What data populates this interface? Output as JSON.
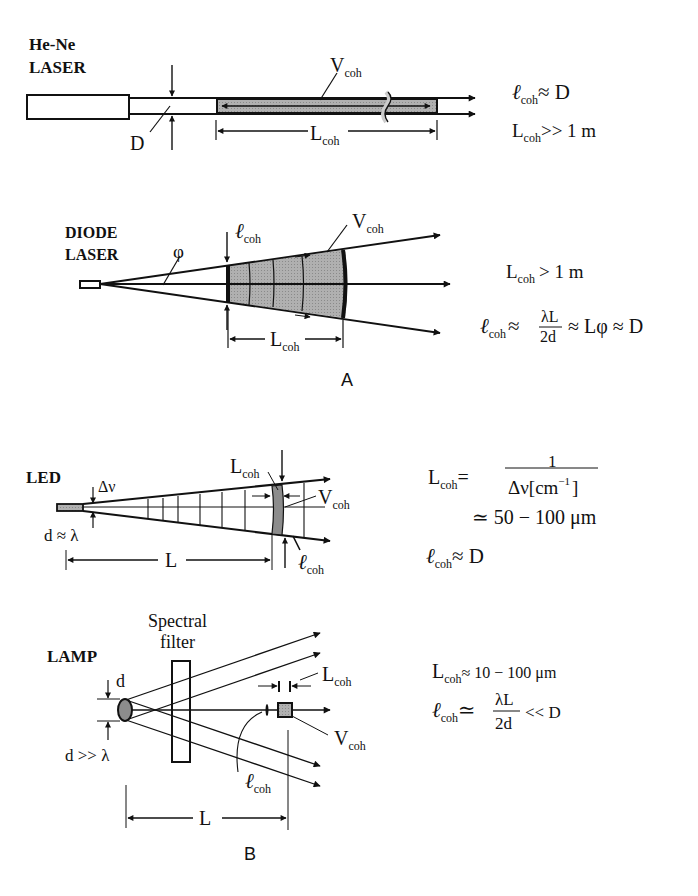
{
  "panels": {
    "A": {
      "label": "A",
      "hene": {
        "title_line1": "He-Ne",
        "title_line2": "LASER",
        "D_label": "D",
        "V_label": "V",
        "V_sub": "coh",
        "L_label": "L",
        "L_sub": "coh",
        "eq1_sym": "ℓ",
        "eq1_sub": "coh",
        "eq1_rest": "≈ D",
        "eq2_sym": "L",
        "eq2_sub": "coh",
        "eq2_rest": ">> 1 m"
      },
      "diode": {
        "title_line1": "DIODE",
        "title_line2": "LASER",
        "phi_label": "φ",
        "l_label": "ℓ",
        "l_sub": "coh",
        "V_label": "V",
        "V_sub": "coh",
        "L_label": "L",
        "L_sub": "coh",
        "eq1_sym": "L",
        "eq1_sub": "coh",
        "eq1_rest": "> 1 m",
        "eq2_sym": "ℓ",
        "eq2_sub": "coh",
        "eq2_approx": "≈",
        "eq2_num": "λL",
        "eq2_den": "2d",
        "eq2_rest": "≈ Lφ ≈ D"
      }
    },
    "B": {
      "label": "B",
      "led": {
        "title": "LED",
        "dnu_label": "Δν",
        "d_label": "d ≈ λ",
        "L_label": "L",
        "Lcoh_label": "L",
        "Lcoh_sub": "coh",
        "V_label": "V",
        "V_sub": "coh",
        "l_label": "ℓ",
        "l_sub": "coh",
        "eq1_sym": "L",
        "eq1_sub": "coh",
        "eq1_eq": "=",
        "eq1_num": "1",
        "eq1_den": "Δν[cm",
        "eq1_den_sup": "−1",
        "eq1_den_close": "]",
        "eq2": "≃ 50 − 100 μm",
        "eq3_sym": "ℓ",
        "eq3_sub": "coh",
        "eq3_rest": "≈ D"
      },
      "lamp": {
        "title": "LAMP",
        "filter_line1": "Spectral",
        "filter_line2": "filter",
        "d_label": "d",
        "d_cond": "d >> λ",
        "L_label": "L",
        "Lcoh_label": "L",
        "Lcoh_sub": "coh",
        "V_label": "V",
        "V_sub": "coh",
        "l_label": "ℓ",
        "l_sub": "coh",
        "eq1_sym": "L",
        "eq1_sub": "coh",
        "eq1_rest": "≈ 10 − 100 μm",
        "eq2_sym": "ℓ",
        "eq2_sub": "coh",
        "eq2_approx": "≃",
        "eq2_num": "λL",
        "eq2_den": "2d",
        "eq2_rest": "<< D"
      }
    }
  },
  "colors": {
    "ink": "#111111",
    "shade": "#9a9a9a",
    "shade_dark": "#7d7d7d"
  }
}
